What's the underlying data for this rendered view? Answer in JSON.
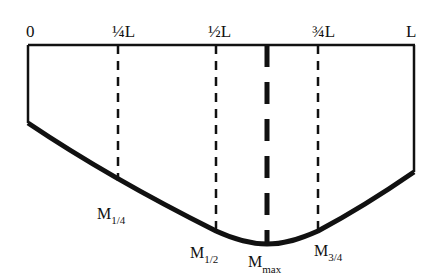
{
  "diagram": {
    "type": "bending-moment-diagram",
    "axis_labels": {
      "start": "0",
      "quarter": "¼L",
      "half": "½L",
      "three_quarter": "¾L",
      "end": "L"
    },
    "moment_labels": {
      "m_quarter": {
        "base": "M",
        "sub": "1/4"
      },
      "m_half": {
        "base": "M",
        "sub": "1/2"
      },
      "m_max": {
        "base": "M",
        "sub": "max"
      },
      "m_three_quarter": {
        "base": "M",
        "sub": "3/4"
      }
    },
    "colors": {
      "line": "#111111",
      "background": "#ffffff"
    }
  }
}
